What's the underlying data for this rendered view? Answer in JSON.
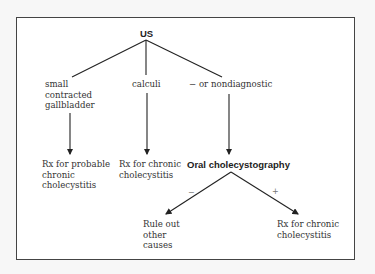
{
  "diagram": {
    "root": {
      "label": "US"
    },
    "us_branches": [
      {
        "label": "small\ncontracted\ngallbladder",
        "result": "Rx for probable\nchronic\ncholecystitis"
      },
      {
        "label": "calculi",
        "result": "Rx for chronic\ncholecystitis"
      },
      {
        "label": "− or nondiagnostic",
        "result": "Oral cholecystography"
      }
    ],
    "ocg_branches": [
      {
        "sign": "−",
        "result": "Rule out\nother\ncauses"
      },
      {
        "sign": "+",
        "result": "Rx for chronic\ncholecystitis"
      }
    ],
    "colors": {
      "line": "#222222",
      "border": "#444444",
      "text": "#333333"
    }
  }
}
